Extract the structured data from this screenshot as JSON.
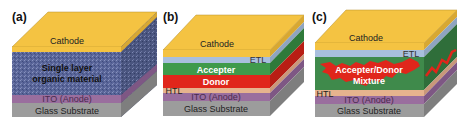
{
  "figure": {
    "panels": [
      {
        "tag": "(a)",
        "type": "single-layer",
        "layers": [
          {
            "name": "Cathode",
            "color": "#F4C342"
          },
          {
            "name": "Single layer",
            "name2": "organic material",
            "color": "#5A6699"
          },
          {
            "name": "ITO (Anode)",
            "color": "#9A6E9E"
          },
          {
            "name": "Glass Substrate",
            "color": "#9C9C9C"
          }
        ]
      },
      {
        "tag": "(b)",
        "type": "bilayer",
        "layers": [
          {
            "name": "Cathode",
            "color": "#F4C342"
          },
          {
            "name": "ETL",
            "color": "#A9BFDD"
          },
          {
            "name": "Accepter",
            "color": "#3F9A4B"
          },
          {
            "name": "Donor",
            "color": "#E0261B"
          },
          {
            "name": "HTL",
            "color": "#E6B38E"
          },
          {
            "name": "ITO (Anode)",
            "color": "#9A6E9E"
          },
          {
            "name": "Glass Substrate",
            "color": "#9C9C9C"
          }
        ]
      },
      {
        "tag": "(c)",
        "type": "bulk-heterojunction",
        "layers": [
          {
            "name": "Cathode",
            "color": "#F4C342"
          },
          {
            "name": "ETL",
            "color": "#A9BFDD"
          },
          {
            "name": "Accepter/Donor",
            "name2": "Mixture",
            "color": "#3F8A4B",
            "accent": "#E0261B"
          },
          {
            "name": "HTL",
            "color": "#E6B38E"
          },
          {
            "name": "ITO (Anode)",
            "color": "#9A6E9E"
          },
          {
            "name": "Glass Substrate",
            "color": "#9C9C9C"
          }
        ]
      }
    ]
  }
}
